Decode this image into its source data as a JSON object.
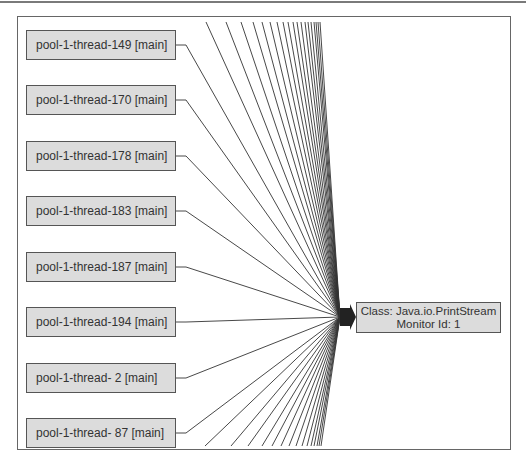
{
  "diagram": {
    "type": "thread-monitor-graph",
    "source_nodes": [
      {
        "label": "pool-1-thread-149 [main]"
      },
      {
        "label": "pool-1-thread-170 [main]"
      },
      {
        "label": "pool-1-thread-178 [main]"
      },
      {
        "label": "pool-1-thread-183 [main]"
      },
      {
        "label": "pool-1-thread-187 [main]"
      },
      {
        "label": "pool-1-thread-194 [main]"
      },
      {
        "label": "pool-1-thread- 2 [main]"
      },
      {
        "label": "pool-1-thread- 87 [main]"
      }
    ],
    "target_node": {
      "line1": "Class: Java.io.PrintStream",
      "line2": "Monitor Id: 1"
    },
    "colors": {
      "node_fill": "#dcdcdc",
      "node_border": "#555555",
      "edge": "#333333"
    }
  }
}
